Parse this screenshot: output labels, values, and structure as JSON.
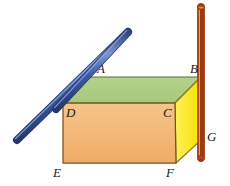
{
  "figure": {
    "background_color": "#ffffff",
    "width": 230,
    "height": 186
  },
  "colors": {
    "top_face": "#aecd84",
    "top_face_edge": "#6f7a3e",
    "front_face": "#f2b877",
    "front_face_edge": "#8a5a22",
    "right_face": "#fbe825",
    "right_face_edge": "#8a7a22",
    "blue_rod": "#3a5aa8",
    "blue_rod_highlight": "#6d87c8",
    "blue_rod_edge": "#25386b",
    "orange_rod": "#d2561f",
    "orange_rod_highlight": "#e79a62",
    "orange_rod_edge": "#9c3a10",
    "label_text": "#1a1a1a"
  },
  "solid": {
    "name": "rectangular-prism",
    "vertices": {
      "A": {
        "x": 88,
        "y": 77
      },
      "B": {
        "x": 201,
        "y": 77
      },
      "C": {
        "x": 175,
        "y": 103
      },
      "D": {
        "x": 63,
        "y": 103
      },
      "E": {
        "x": 63,
        "y": 163
      },
      "F": {
        "x": 176,
        "y": 163
      },
      "G": {
        "x": 201,
        "y": 140
      }
    },
    "faces": [
      {
        "name": "top-face",
        "color_key": "top_face",
        "points": "88,77 201,77 175,103 63,103"
      },
      {
        "name": "front-face",
        "color_key": "front_face",
        "points": "63,103 175,103 176,163 63,163"
      },
      {
        "name": "right-face",
        "color_key": "right_face",
        "points": "201,77 175,103 176,163 201,140"
      }
    ]
  },
  "labels": [
    {
      "name": "vertex-label-A",
      "text": "A",
      "x": 97,
      "y": 62
    },
    {
      "name": "vertex-label-B",
      "text": "B",
      "x": 190,
      "y": 62
    },
    {
      "name": "vertex-label-C",
      "text": "C",
      "x": 163,
      "y": 106
    },
    {
      "name": "vertex-label-D",
      "text": "D",
      "x": 66,
      "y": 106
    },
    {
      "name": "vertex-label-E",
      "text": "E",
      "x": 53,
      "y": 166
    },
    {
      "name": "vertex-label-F",
      "text": "F",
      "x": 166,
      "y": 166
    },
    {
      "name": "vertex-label-G",
      "text": "G",
      "x": 207,
      "y": 130
    }
  ],
  "rods": [
    {
      "name": "blue-rod",
      "color_key": "blue_rod",
      "x1": 17,
      "y1": 140,
      "x2": 128,
      "y2": 32,
      "thickness": 7
    },
    {
      "name": "orange-rod",
      "color_key": "orange_rod",
      "x1": 201,
      "y1": 7,
      "x2": 201,
      "y2": 158,
      "thickness": 6
    }
  ]
}
